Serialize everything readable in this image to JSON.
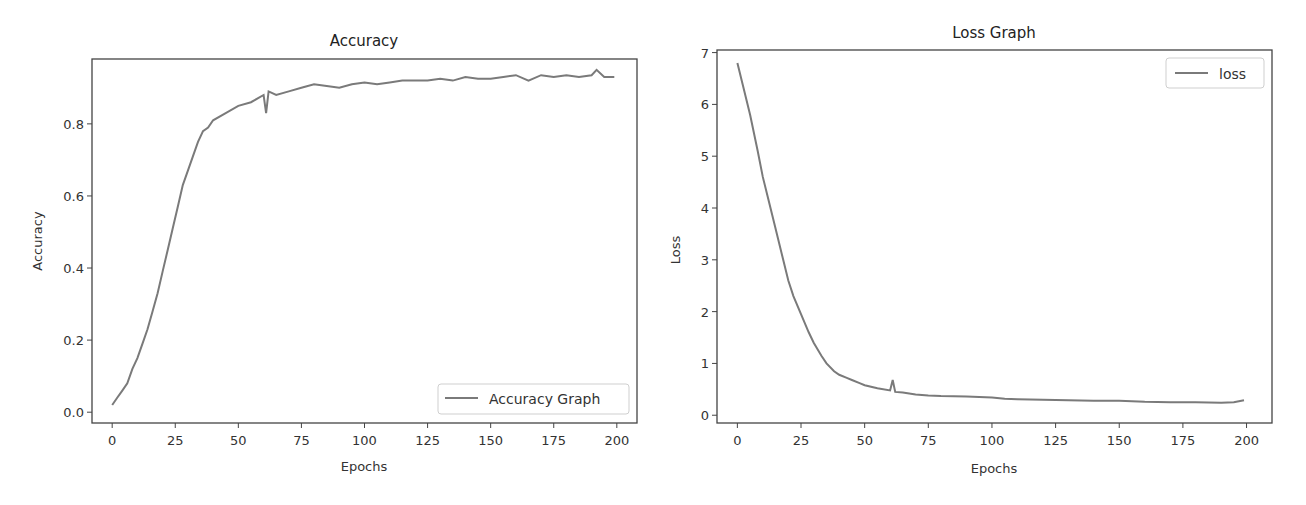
{
  "chart_data": [
    {
      "type": "line",
      "title": "Accuracy",
      "xlabel": "Epochs",
      "ylabel": "Accuracy",
      "xlim": [
        -8,
        208
      ],
      "ylim": [
        -0.03,
        0.98
      ],
      "xticks": [
        0,
        25,
        50,
        75,
        100,
        125,
        150,
        175,
        200
      ],
      "yticks": [
        0.0,
        0.2,
        0.4,
        0.6,
        0.8
      ],
      "ytick_labels": [
        "0.0",
        "0.2",
        "0.4",
        "0.6",
        "0.8"
      ],
      "grid": false,
      "legend_position": "lower right",
      "series": [
        {
          "name": "Accuracy Graph",
          "color": "#7a7a7a",
          "x": [
            0,
            2,
            4,
            6,
            8,
            10,
            12,
            14,
            16,
            18,
            20,
            22,
            24,
            26,
            28,
            30,
            32,
            34,
            36,
            38,
            40,
            45,
            50,
            55,
            60,
            61,
            62,
            65,
            70,
            75,
            80,
            85,
            90,
            95,
            100,
            105,
            110,
            115,
            120,
            125,
            130,
            135,
            140,
            145,
            150,
            155,
            160,
            165,
            170,
            175,
            180,
            185,
            190,
            192,
            195,
            199
          ],
          "values": [
            0.02,
            0.04,
            0.06,
            0.08,
            0.12,
            0.15,
            0.19,
            0.23,
            0.28,
            0.33,
            0.39,
            0.45,
            0.51,
            0.57,
            0.63,
            0.67,
            0.71,
            0.75,
            0.78,
            0.79,
            0.81,
            0.83,
            0.85,
            0.86,
            0.88,
            0.83,
            0.89,
            0.88,
            0.89,
            0.9,
            0.91,
            0.905,
            0.9,
            0.91,
            0.915,
            0.91,
            0.915,
            0.92,
            0.92,
            0.92,
            0.925,
            0.92,
            0.93,
            0.925,
            0.925,
            0.93,
            0.935,
            0.92,
            0.935,
            0.93,
            0.935,
            0.93,
            0.935,
            0.95,
            0.93,
            0.93
          ]
        }
      ]
    },
    {
      "type": "line",
      "title": "Loss Graph",
      "xlabel": "Epochs",
      "ylabel": "Loss",
      "xlim": [
        -8,
        210
      ],
      "ylim": [
        -0.15,
        7.05
      ],
      "xticks": [
        0,
        25,
        50,
        75,
        100,
        125,
        150,
        175,
        200
      ],
      "yticks": [
        0,
        1,
        2,
        3,
        4,
        5,
        6,
        7
      ],
      "ytick_labels": [
        "0",
        "1",
        "2",
        "3",
        "4",
        "5",
        "6",
        "7"
      ],
      "grid": false,
      "legend_position": "upper right",
      "series": [
        {
          "name": "loss",
          "color": "#7a7a7a",
          "x": [
            0,
            2,
            5,
            8,
            10,
            12,
            15,
            18,
            20,
            22,
            25,
            28,
            30,
            33,
            35,
            38,
            40,
            43,
            45,
            48,
            50,
            55,
            60,
            61,
            62,
            65,
            70,
            75,
            80,
            90,
            100,
            105,
            110,
            120,
            130,
            140,
            150,
            160,
            170,
            180,
            190,
            195,
            199
          ],
          "values": [
            6.8,
            6.4,
            5.8,
            5.1,
            4.6,
            4.2,
            3.6,
            3.0,
            2.6,
            2.3,
            1.95,
            1.6,
            1.4,
            1.15,
            1.0,
            0.85,
            0.78,
            0.72,
            0.68,
            0.62,
            0.58,
            0.52,
            0.48,
            0.68,
            0.45,
            0.44,
            0.4,
            0.38,
            0.37,
            0.36,
            0.34,
            0.32,
            0.31,
            0.3,
            0.29,
            0.28,
            0.28,
            0.26,
            0.25,
            0.25,
            0.24,
            0.25,
            0.29
          ]
        }
      ]
    }
  ],
  "charts": {
    "left": {
      "title": "Accuracy",
      "xlabel": "Epochs",
      "ylabel": "Accuracy",
      "legend_label": "Accuracy Graph"
    },
    "right": {
      "title": "Loss Graph",
      "xlabel": "Epochs",
      "ylabel": "Loss",
      "legend_label": "loss"
    }
  }
}
